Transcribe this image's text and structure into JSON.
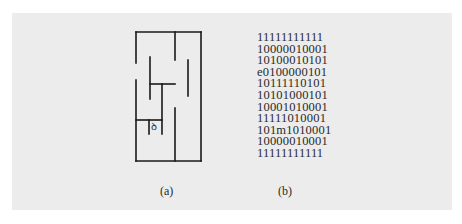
{
  "figure": {
    "panel_background": "#ececec",
    "line_color": "#1a1a1a",
    "maze": {
      "caption": "(a)",
      "mouse_glyph": "ꝺ",
      "outer_wall": {
        "left": 136,
        "top": 32,
        "right": 201,
        "bottom": 161
      },
      "entrance_gap_left_wall": {
        "y_start": 63,
        "y_end": 80
      },
      "walls": [
        {
          "x1": 175,
          "y1": 32,
          "x2": 175,
          "y2": 60
        },
        {
          "x1": 150,
          "y1": 57,
          "x2": 150,
          "y2": 99
        },
        {
          "x1": 150,
          "y1": 84,
          "x2": 175,
          "y2": 84
        },
        {
          "x1": 162,
          "y1": 84,
          "x2": 162,
          "y2": 134
        },
        {
          "x1": 188,
          "y1": 60,
          "x2": 188,
          "y2": 96
        },
        {
          "x1": 175,
          "y1": 108,
          "x2": 175,
          "y2": 161
        },
        {
          "x1": 136,
          "y1": 120,
          "x2": 162,
          "y2": 120
        },
        {
          "x1": 149,
          "y1": 120,
          "x2": 149,
          "y2": 134
        }
      ]
    },
    "matrix": {
      "caption": "(b)",
      "rows": [
        "11111111111",
        "10000010001",
        "10100010101",
        "e0100000101",
        "10111110101",
        "10101000101",
        "10001010001",
        "11111010001",
        "101m1010001",
        "10000010001",
        "11111111111"
      ]
    }
  }
}
